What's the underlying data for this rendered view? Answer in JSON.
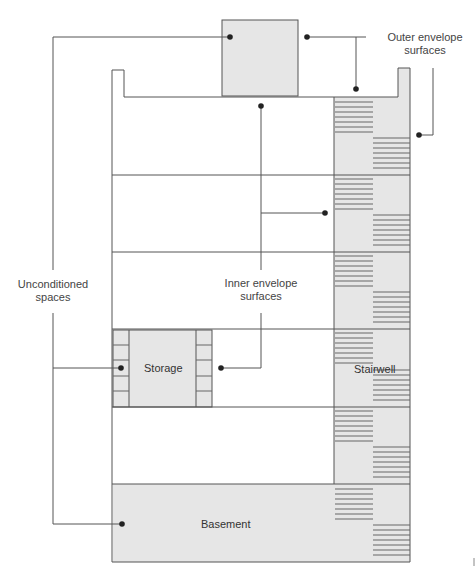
{
  "diagram": {
    "labels": {
      "outer_envelope": {
        "line1": "Outer envelope",
        "line2": "surfaces"
      },
      "inner_envelope": {
        "line1": "Inner envelope",
        "line2": "surfaces"
      },
      "unconditioned": {
        "line1": "Unconditioned",
        "line2": "spaces"
      }
    },
    "rooms": {
      "storage": "Storage",
      "stairwell": "Stairwell",
      "basement": "Basement"
    },
    "colors": {
      "line": "#555555",
      "fill_unconditioned": "#e6e6e6",
      "stair_tread": "#666666",
      "dot": "#222222"
    }
  }
}
